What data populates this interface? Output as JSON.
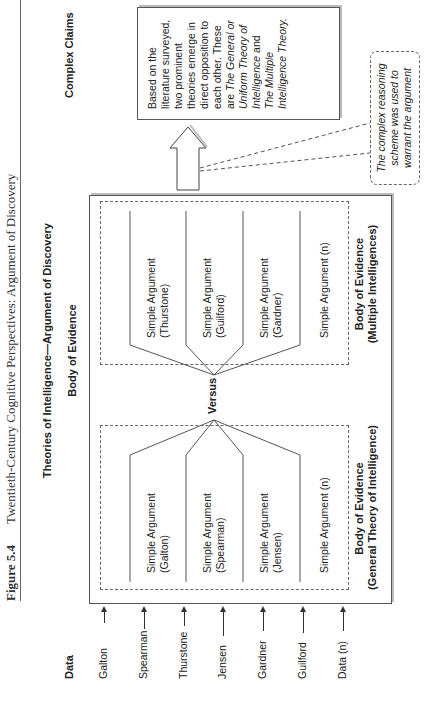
{
  "caption": {
    "figure_label": "Figure 5.4",
    "text": "Twentieth-Century Cognitive Perspectives: Argument of Discovery"
  },
  "title": "Theories of Intelligence—Argument of Discovery",
  "columns": {
    "data": "Data",
    "body_of_evidence": "Body of Evidence",
    "complex_claims": "Complex Claims"
  },
  "data_items": [
    "Galton",
    "Spearman",
    "Thurstone",
    "Jensen",
    "Gardner",
    "Guilford",
    "Data (n)"
  ],
  "general_theory_group": {
    "label_line1": "Body of Evidence",
    "label_line2": "(General Theory of Intelligence)",
    "arguments": [
      {
        "line1": "Simple Argument",
        "line2": "(Galton)"
      },
      {
        "line1": "Simple Argument",
        "line2": "(Spearman)"
      },
      {
        "line1": "Simple Argument",
        "line2": "(Jensen)"
      },
      {
        "line1": "Simple Argument (n)",
        "line2": ""
      }
    ]
  },
  "versus_label": "Versus",
  "multiple_intelligences_group": {
    "label_line1": "Body of Evidence",
    "label_line2": "(Multiple Intelligences)",
    "arguments": [
      {
        "line1": "Simple Argument",
        "line2": "(Thurstone)"
      },
      {
        "line1": "Simple Argument",
        "line2": "(Guilford)"
      },
      {
        "line1": "Simple Argument",
        "line2": "(Gardner)"
      },
      {
        "line1": "Simple Argument (n)",
        "line2": ""
      }
    ]
  },
  "claim": {
    "plain": "Based on the literature surveyed, two prominent theories emerge in direct opposition to each other. These are ",
    "italic1": "The General or Uniform Theory of Intelligence",
    "joiner": " and ",
    "italic2": "The Multiple Intelligence Theory."
  },
  "callout": "The complex reasoning scheme was used to warrant the argument"
}
